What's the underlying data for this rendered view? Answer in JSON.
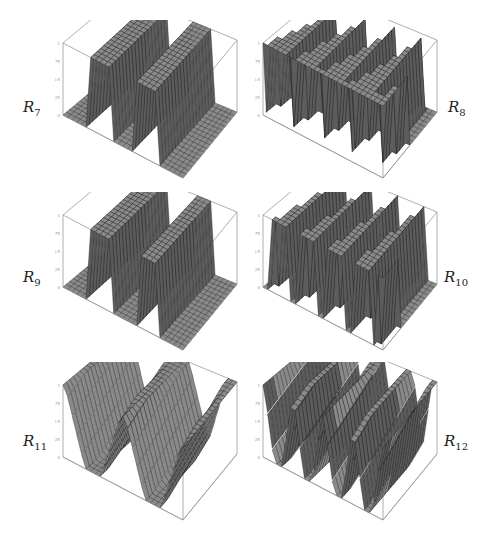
{
  "figure": {
    "panels": [
      {
        "id": "R7",
        "symbol": "R",
        "subscript": "7",
        "steps": 2.5,
        "shape": "box",
        "label_side": "left",
        "origin": [
          55,
          20
        ]
      },
      {
        "id": "R8",
        "symbol": "R",
        "subscript": "8",
        "steps": 4.5,
        "shape": "tri",
        "label_side": "right",
        "origin": [
          255,
          20
        ]
      },
      {
        "id": "R9",
        "symbol": "R",
        "subscript": "9",
        "steps": 2.5,
        "shape": "curve",
        "label_side": "left",
        "origin": [
          55,
          192
        ]
      },
      {
        "id": "R10",
        "symbol": "R",
        "subscript": "10",
        "steps": 4.5,
        "shape": "curvetri",
        "label_side": "right",
        "origin": [
          255,
          192
        ]
      },
      {
        "id": "R11",
        "symbol": "R",
        "subscript": "11",
        "steps": 2,
        "shape": "slope",
        "label_side": "left",
        "origin": [
          55,
          362
        ]
      },
      {
        "id": "R12",
        "symbol": "R",
        "subscript": "12",
        "steps": 4,
        "shape": "slope",
        "label_side": "right",
        "origin": [
          255,
          362
        ]
      }
    ],
    "z_ticks": [
      "1",
      "0.75",
      "0.5",
      "0.25",
      "0"
    ],
    "surface_color": "#8a8a8a",
    "surface_dark": "#5c5c5c",
    "mesh_color": "#1a1a1a",
    "box_color": "#9a9a9a"
  },
  "labels": {
    "R7": {
      "base": "R",
      "sub": "7"
    },
    "R8": {
      "base": "R",
      "sub": "8"
    },
    "R9": {
      "base": "R",
      "sub": "9"
    },
    "R10": {
      "base": "R",
      "sub": "10"
    },
    "R11": {
      "base": "R",
      "sub": "11"
    },
    "R12": {
      "base": "R",
      "sub": "12"
    }
  }
}
